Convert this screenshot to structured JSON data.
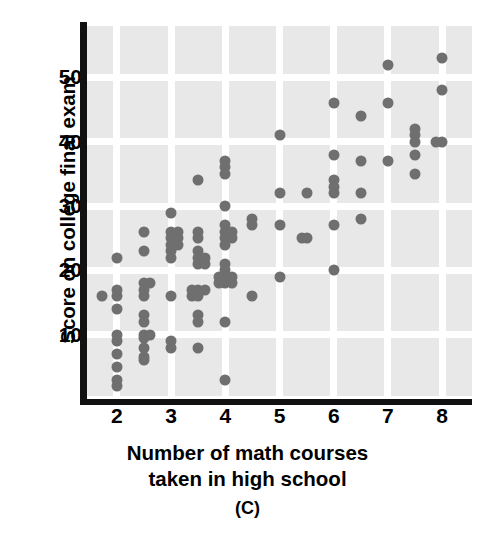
{
  "chart_data": {
    "type": "scatter",
    "title": "",
    "panel_label": "(C)",
    "xlabel": "Number of math courses",
    "xlabel_line2": "taken in high school",
    "ylabel": "Score on college final exam",
    "xlim": [
      1.45,
      8.55
    ],
    "ylim": [
      0,
      58
    ],
    "xticks": [
      2,
      3,
      4,
      5,
      6,
      7,
      8
    ],
    "yticks": [
      10,
      20,
      30,
      40,
      50
    ],
    "grid": true,
    "grid_color": "#ffffff",
    "plot_background": "#e8e8e8",
    "point_color": "#6f6f6f",
    "point_size_px": 11,
    "legend": null,
    "n_points": 116,
    "points": [
      [
        1.72,
        16
      ],
      [
        2.0,
        22
      ],
      [
        2.0,
        17
      ],
      [
        2.0,
        16
      ],
      [
        2.0,
        14
      ],
      [
        2.0,
        10
      ],
      [
        2.0,
        9
      ],
      [
        2.0,
        7
      ],
      [
        2.0,
        5
      ],
      [
        2.0,
        3
      ],
      [
        2.0,
        2
      ],
      [
        2.5,
        26
      ],
      [
        2.5,
        23
      ],
      [
        2.5,
        18
      ],
      [
        2.5,
        17
      ],
      [
        2.5,
        16
      ],
      [
        2.5,
        13
      ],
      [
        2.5,
        12
      ],
      [
        2.5,
        10
      ],
      [
        2.5,
        9.5
      ],
      [
        2.5,
        8
      ],
      [
        2.5,
        6.5
      ],
      [
        2.5,
        6
      ],
      [
        2.62,
        18
      ],
      [
        2.62,
        10
      ],
      [
        3.0,
        29
      ],
      [
        3.0,
        26
      ],
      [
        3.0,
        25
      ],
      [
        3.0,
        24
      ],
      [
        3.0,
        23
      ],
      [
        3.0,
        22
      ],
      [
        3.0,
        16
      ],
      [
        3.0,
        9
      ],
      [
        3.0,
        8
      ],
      [
        3.12,
        26
      ],
      [
        3.12,
        25
      ],
      [
        3.12,
        24
      ],
      [
        3.5,
        34
      ],
      [
        3.5,
        26
      ],
      [
        3.5,
        25
      ],
      [
        3.5,
        23
      ],
      [
        3.5,
        22
      ],
      [
        3.5,
        21
      ],
      [
        3.5,
        17
      ],
      [
        3.5,
        16
      ],
      [
        3.5,
        13
      ],
      [
        3.5,
        12
      ],
      [
        3.5,
        8
      ],
      [
        3.62,
        22
      ],
      [
        3.62,
        17
      ],
      [
        3.62,
        21
      ],
      [
        3.38,
        17
      ],
      [
        3.38,
        16
      ],
      [
        4.0,
        37
      ],
      [
        4.0,
        36
      ],
      [
        4.0,
        35
      ],
      [
        4.0,
        30
      ],
      [
        4.0,
        27
      ],
      [
        4.0,
        26
      ],
      [
        4.0,
        25
      ],
      [
        4.0,
        24
      ],
      [
        4.0,
        21
      ],
      [
        4.0,
        20
      ],
      [
        4.0,
        19
      ],
      [
        4.0,
        18
      ],
      [
        4.0,
        12
      ],
      [
        4.0,
        3
      ],
      [
        4.12,
        26
      ],
      [
        4.12,
        25
      ],
      [
        4.12,
        19
      ],
      [
        4.12,
        18
      ],
      [
        3.88,
        19
      ],
      [
        3.88,
        18
      ],
      [
        4.5,
        28
      ],
      [
        4.5,
        27
      ],
      [
        4.5,
        16
      ],
      [
        5.0,
        41
      ],
      [
        5.0,
        32
      ],
      [
        5.0,
        27
      ],
      [
        5.0,
        19
      ],
      [
        5.5,
        32
      ],
      [
        5.5,
        25
      ],
      [
        5.42,
        25
      ],
      [
        6.0,
        46
      ],
      [
        6.0,
        38
      ],
      [
        6.0,
        34
      ],
      [
        6.0,
        33
      ],
      [
        6.0,
        32
      ],
      [
        6.0,
        27
      ],
      [
        6.0,
        20
      ],
      [
        6.5,
        44
      ],
      [
        6.5,
        37
      ],
      [
        6.5,
        32
      ],
      [
        6.5,
        28
      ],
      [
        7.0,
        52
      ],
      [
        7.0,
        46
      ],
      [
        7.0,
        37
      ],
      [
        7.5,
        42
      ],
      [
        7.5,
        41
      ],
      [
        7.5,
        40
      ],
      [
        7.5,
        38
      ],
      [
        7.5,
        35
      ],
      [
        8.0,
        53
      ],
      [
        8.0,
        48
      ],
      [
        8.0,
        40
      ],
      [
        7.88,
        40
      ]
    ]
  }
}
